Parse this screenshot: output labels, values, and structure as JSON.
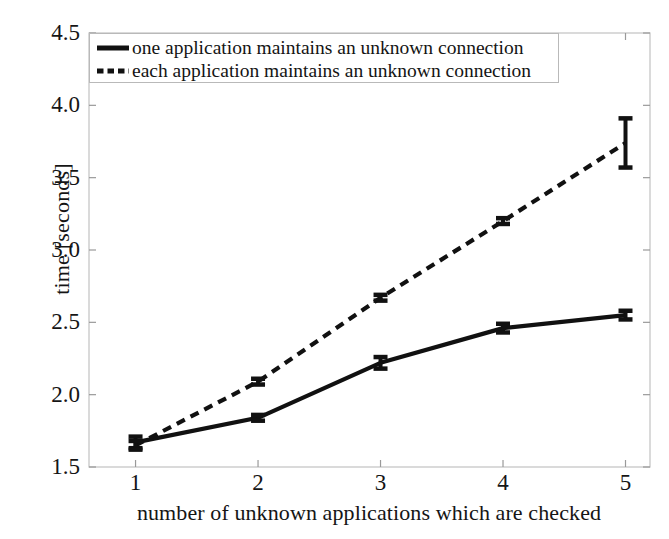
{
  "chart_data": {
    "type": "line",
    "title": "",
    "xlabel": "number of unknown applications which are checked",
    "ylabel": "time [seconds]",
    "x": [
      1,
      2,
      3,
      4,
      5
    ],
    "xtick_labels": [
      "1",
      "2",
      "3",
      "4",
      "5"
    ],
    "ytick_labels": [
      "1.5",
      "2.0",
      "2.5",
      "3.0",
      "3.5",
      "4.0",
      "4.5"
    ],
    "ytick_values": [
      1.5,
      2.0,
      2.5,
      3.0,
      3.5,
      4.0,
      4.5
    ],
    "xlim": [
      0.62,
      5.2
    ],
    "ylim": [
      1.5,
      4.5
    ],
    "grid": false,
    "legend_position": "upper left",
    "series": [
      {
        "name": "one application maintains an unknown connection",
        "style": "solid",
        "color": "#111111",
        "values": [
          1.67,
          1.84,
          2.22,
          2.46,
          2.55
        ],
        "errors": [
          0.04,
          0.02,
          0.04,
          0.03,
          0.03
        ]
      },
      {
        "name": "each application maintains an unknown connection",
        "style": "dashed",
        "color": "#111111",
        "values": [
          1.65,
          2.09,
          2.67,
          3.2,
          3.74
        ],
        "errors": [
          0.03,
          0.02,
          0.02,
          0.02,
          0.17
        ]
      }
    ]
  },
  "legend": {
    "entries": [
      {
        "label": "one application maintains an unknown connection",
        "icon": "solid-line-swatch"
      },
      {
        "label": "each application maintains an unknown connection",
        "icon": "dashed-line-swatch"
      }
    ]
  },
  "axes": {
    "ylabel": "time [seconds]",
    "xlabel": "number of unknown applications which are checked"
  }
}
